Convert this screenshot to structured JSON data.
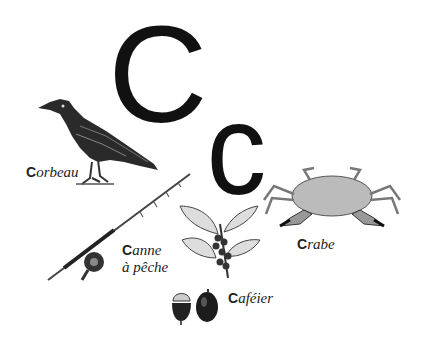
{
  "letters": {
    "uppercase": "C",
    "lowercase": "c"
  },
  "items": [
    {
      "id": "corbeau",
      "initial": "C",
      "rest": "orbeau",
      "icon": "raven-illustration"
    },
    {
      "id": "canne",
      "initial": "C",
      "rest": "anne",
      "line2": "à pêche",
      "icon": "fishing-rod-illustration"
    },
    {
      "id": "cafeier",
      "initial": "C",
      "rest": "aféier",
      "icon": "coffee-plant-illustration"
    },
    {
      "id": "crabe",
      "initial": "C",
      "rest": "rabe",
      "icon": "crab-illustration"
    }
  ],
  "colors": {
    "ink": "#111111",
    "background": "#ffffff"
  }
}
